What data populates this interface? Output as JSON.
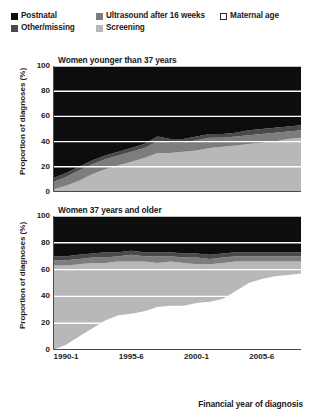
{
  "legend": {
    "rows": [
      [
        {
          "label": "Postnatal",
          "color": "#0d0d0d",
          "bordered": false,
          "width_class": "li-w1"
        },
        {
          "label": "Ultrasound after 16 weeks",
          "color": "#7d7d7d",
          "bordered": false,
          "width_class": "li-w2"
        },
        {
          "label": "Maternal age",
          "color": "#ffffff",
          "bordered": true,
          "width_class": ""
        }
      ],
      [
        {
          "label": "Other/missing",
          "color": "#4a4a4a",
          "bordered": false,
          "width_class": "li-w1"
        },
        {
          "label": "Screening",
          "color": "#b8b8b8",
          "bordered": false,
          "width_class": "li-w2"
        }
      ]
    ]
  },
  "axis": {
    "ylabel": "Proportion of diagnoses (%)",
    "xlabel": "Financial year of diagnosis",
    "yticks": [
      100,
      80,
      60,
      40,
      20,
      0
    ],
    "xticks": [
      {
        "label": "1990-1",
        "x": 1990
      },
      {
        "label": "1995-6",
        "x": 1995
      },
      {
        "label": "2000-1",
        "x": 2000
      },
      {
        "label": "2005-6",
        "x": 2005
      }
    ]
  },
  "colors": {
    "postnatal": "#0d0d0d",
    "other_missing": "#4a4a4a",
    "ultrasound_after_16_weeks": "#7d7d7d",
    "screening": "#b8b8b8",
    "maternal_age": "#ffffff",
    "gridline": "#ffffff",
    "axis": "#4a4a4a",
    "text": "#1a1a1a"
  },
  "chart_data": [
    {
      "type": "area",
      "panel_id": "top",
      "title": "Women younger than 37 years",
      "xlabel": "Financial year of diagnosis",
      "ylabel": "Proportion of diagnoses (%)",
      "ylim": [
        0,
        100
      ],
      "xlim": [
        1989,
        2008
      ],
      "grid": true,
      "stacked": true,
      "stack_order_bottom_to_top": [
        "Maternal age",
        "Screening",
        "Ultrasound after 16 weeks",
        "Other/missing",
        "Postnatal"
      ],
      "legend_position": "top",
      "x": [
        1989,
        1990,
        1991,
        1992,
        1993,
        1994,
        1995,
        1996,
        1997,
        1998,
        1999,
        2000,
        2001,
        2002,
        2003,
        2004,
        2005,
        2006,
        2007,
        2008
      ],
      "series": [
        {
          "name": "Maternal age",
          "values": [
            0,
            0,
            0,
            0,
            0,
            0,
            0,
            0,
            0,
            0,
            0,
            0,
            0,
            0,
            0,
            0,
            0,
            0,
            0,
            0
          ]
        },
        {
          "name": "Screening",
          "values": [
            2,
            5,
            9,
            14,
            18,
            21,
            24,
            27,
            31,
            31,
            32,
            33,
            35,
            36,
            37,
            38,
            39,
            40,
            42,
            43
          ]
        },
        {
          "name": "Ultrasound after 16 weeks",
          "values": [
            6,
            7,
            8,
            8,
            8,
            8,
            8,
            8,
            9,
            8,
            7,
            8,
            8,
            7,
            7,
            7,
            7,
            7,
            6,
            6
          ]
        },
        {
          "name": "Other/missing",
          "values": [
            3,
            3,
            3,
            3,
            3,
            3,
            3,
            3,
            4,
            3,
            3,
            3,
            3,
            3,
            3,
            4,
            4,
            4,
            4,
            4
          ]
        },
        {
          "name": "Postnatal",
          "values": [
            89,
            85,
            80,
            75,
            71,
            68,
            65,
            62,
            56,
            58,
            58,
            56,
            54,
            54,
            53,
            51,
            50,
            49,
            48,
            47
          ]
        }
      ]
    },
    {
      "type": "area",
      "panel_id": "bottom",
      "title": "Women 37 years and older",
      "xlabel": "Financial year of diagnosis",
      "ylabel": "Proportion of diagnoses (%)",
      "ylim": [
        0,
        100
      ],
      "xlim": [
        1989,
        2008
      ],
      "grid": true,
      "stacked": true,
      "stack_order_bottom_to_top": [
        "Maternal age",
        "Screening",
        "Ultrasound after 16 weeks",
        "Other/missing",
        "Postnatal"
      ],
      "legend_position": "top",
      "x": [
        1989,
        1990,
        1991,
        1992,
        1993,
        1994,
        1995,
        1996,
        1997,
        1998,
        1999,
        2000,
        2001,
        2002,
        2003,
        2004,
        2005,
        2006,
        2007,
        2008
      ],
      "series": [
        {
          "name": "Maternal age",
          "values": [
            0,
            4,
            10,
            16,
            22,
            26,
            27,
            29,
            32,
            33,
            33,
            35,
            36,
            38,
            44,
            50,
            53,
            55,
            56,
            57
          ]
        },
        {
          "name": "Screening",
          "values": [
            63,
            59,
            54,
            49,
            43,
            40,
            39,
            37,
            33,
            33,
            32,
            29,
            28,
            27,
            22,
            16,
            13,
            11,
            10,
            9
          ]
        },
        {
          "name": "Ultrasound after 16 weeks",
          "values": [
            4,
            4,
            4,
            4,
            4,
            4,
            5,
            4,
            5,
            4,
            4,
            5,
            4,
            4,
            4,
            4,
            4,
            4,
            4,
            4
          ]
        },
        {
          "name": "Other/missing",
          "values": [
            3,
            3,
            3,
            3,
            4,
            3,
            3,
            3,
            3,
            3,
            3,
            3,
            3,
            3,
            3,
            3,
            3,
            3,
            3,
            3
          ]
        },
        {
          "name": "Postnatal",
          "values": [
            30,
            30,
            29,
            28,
            27,
            27,
            26,
            27,
            27,
            27,
            28,
            28,
            29,
            28,
            27,
            27,
            27,
            27,
            27,
            27
          ]
        }
      ]
    }
  ]
}
